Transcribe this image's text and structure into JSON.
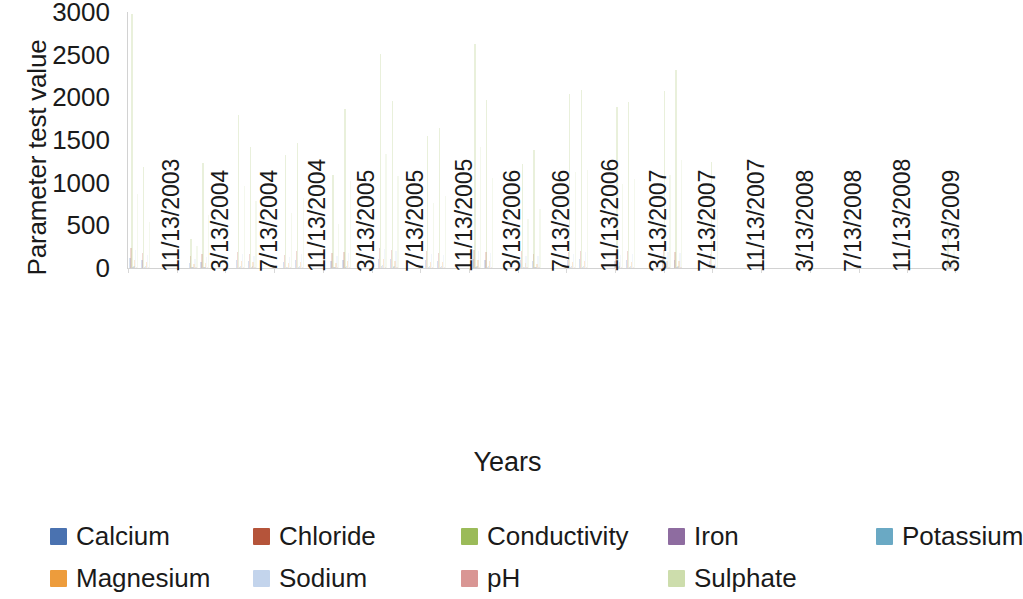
{
  "chart_data": {
    "type": "bar",
    "title": "",
    "xlabel": "Years",
    "ylabel": "Parameter test value",
    "ylim": [
      0,
      3000
    ],
    "y_ticks": [
      3000,
      2500,
      2000,
      1500,
      1000,
      500,
      0
    ],
    "grid": false,
    "legend_position": "bottom",
    "x_tick_labels": [
      "11/13/2003",
      "3/13/2004",
      "7/13/2004",
      "11/13/2004",
      "3/13/2005",
      "7/13/2005",
      "11/13/2005",
      "3/13/2006",
      "7/13/2006",
      "11/13/2006",
      "3/13/2007",
      "7/13/2007",
      "11/13/2007",
      "3/13/2008",
      "7/13/2008",
      "11/13/2008",
      "3/13/2009"
    ],
    "series": [
      {
        "name": "Calcium",
        "color": "#4a72b0",
        "values": [
          120,
          95,
          0,
          0,
          0,
          60,
          75,
          0,
          0,
          90,
          80,
          0,
          0,
          70,
          95,
          0,
          0,
          85,
          90,
          0,
          0,
          110,
          100,
          0,
          0,
          95,
          85,
          0,
          0,
          105,
          90,
          0,
          0,
          95,
          80,
          0,
          0,
          90,
          100,
          0,
          0,
          85,
          95,
          0,
          0,
          100,
          90,
          0,
          0,
          80,
          0,
          0,
          0,
          0,
          0,
          0,
          0,
          0,
          0,
          0,
          0,
          0,
          0,
          0,
          0,
          0,
          0,
          0,
          0,
          55
        ]
      },
      {
        "name": "Chloride",
        "color": "#b5543a",
        "values": [
          230,
          180,
          0,
          0,
          0,
          140,
          160,
          0,
          0,
          190,
          170,
          0,
          0,
          150,
          200,
          0,
          0,
          175,
          185,
          0,
          0,
          240,
          210,
          0,
          0,
          195,
          180,
          0,
          0,
          215,
          190,
          0,
          0,
          200,
          165,
          0,
          0,
          185,
          205,
          0,
          0,
          175,
          195,
          0,
          0,
          210,
          185,
          0,
          0,
          160,
          0,
          0,
          0,
          0,
          0,
          0,
          0,
          0,
          0,
          0,
          0,
          0,
          0,
          0,
          0,
          0,
          0,
          0,
          0,
          95
        ]
      },
      {
        "name": "Conductivity",
        "color": "#9bbb59",
        "values": [
          2980,
          1180,
          0,
          0,
          0,
          340,
          1230,
          0,
          0,
          1790,
          1420,
          0,
          0,
          1320,
          1460,
          0,
          0,
          1090,
          1860,
          0,
          0,
          2510,
          1960,
          0,
          0,
          1550,
          1640,
          0,
          0,
          2620,
          1970,
          0,
          0,
          1220,
          1380,
          0,
          0,
          2040,
          2090,
          0,
          0,
          1890,
          1950,
          0,
          0,
          2070,
          2320,
          0,
          0,
          1240,
          0,
          0,
          0,
          0,
          0,
          0,
          0,
          0,
          0,
          0,
          0,
          0,
          0,
          0,
          0,
          0,
          0,
          0,
          0,
          420
        ]
      },
      {
        "name": "Iron",
        "color": "#8e6ca0",
        "values": [
          15,
          8,
          0,
          0,
          0,
          5,
          9,
          0,
          0,
          12,
          10,
          0,
          0,
          7,
          11,
          0,
          0,
          9,
          13,
          0,
          0,
          18,
          14,
          0,
          0,
          11,
          10,
          0,
          0,
          16,
          12,
          0,
          0,
          9,
          8,
          0,
          0,
          13,
          15,
          0,
          0,
          11,
          12,
          0,
          0,
          14,
          13,
          0,
          0,
          7,
          0,
          0,
          0,
          0,
          0,
          0,
          0,
          0,
          0,
          0,
          0,
          0,
          0,
          0,
          0,
          0,
          0,
          0,
          0,
          4
        ]
      },
      {
        "name": "Potassium",
        "color": "#6aa9c4",
        "values": [
          25,
          18,
          0,
          0,
          0,
          12,
          16,
          0,
          0,
          22,
          19,
          0,
          0,
          15,
          21,
          0,
          0,
          17,
          24,
          0,
          0,
          30,
          26,
          0,
          0,
          20,
          18,
          0,
          0,
          28,
          23,
          0,
          0,
          17,
          15,
          0,
          0,
          22,
          25,
          0,
          0,
          19,
          21,
          0,
          0,
          24,
          23,
          0,
          0,
          14,
          0,
          0,
          0,
          0,
          0,
          0,
          0,
          0,
          0,
          0,
          0,
          0,
          0,
          0,
          0,
          0,
          0,
          0,
          0,
          8
        ]
      },
      {
        "name": "Magnesium",
        "color": "#ed9c3c",
        "values": [
          95,
          70,
          0,
          0,
          0,
          45,
          60,
          0,
          0,
          78,
          66,
          0,
          0,
          55,
          72,
          0,
          0,
          62,
          80,
          0,
          0,
          105,
          88,
          0,
          0,
          74,
          68,
          0,
          0,
          92,
          77,
          0,
          0,
          60,
          52,
          0,
          0,
          76,
          84,
          0,
          0,
          70,
          75,
          0,
          0,
          82,
          79,
          0,
          0,
          50,
          0,
          0,
          0,
          0,
          0,
          0,
          0,
          0,
          0,
          0,
          0,
          0,
          0,
          0,
          0,
          0,
          0,
          0,
          0,
          30
        ]
      },
      {
        "name": "Sodium",
        "color": "#c3d4ec",
        "values": [
          210,
          150,
          0,
          0,
          0,
          110,
          130,
          0,
          0,
          165,
          145,
          0,
          0,
          125,
          170,
          0,
          0,
          140,
          180,
          0,
          0,
          225,
          195,
          0,
          0,
          160,
          150,
          0,
          0,
          200,
          175,
          0,
          0,
          145,
          135,
          0,
          0,
          170,
          190,
          0,
          0,
          155,
          165,
          0,
          0,
          185,
          175,
          0,
          0,
          130,
          0,
          0,
          0,
          0,
          0,
          0,
          0,
          0,
          0,
          0,
          0,
          0,
          0,
          0,
          0,
          0,
          0,
          0,
          0,
          75
        ]
      },
      {
        "name": "pH",
        "color": "#d99694",
        "values": [
          8,
          7,
          0,
          0,
          0,
          7,
          7,
          0,
          0,
          8,
          7,
          0,
          0,
          7,
          8,
          0,
          0,
          7,
          8,
          0,
          0,
          8,
          8,
          0,
          0,
          7,
          7,
          0,
          0,
          8,
          7,
          0,
          0,
          7,
          7,
          0,
          0,
          8,
          8,
          0,
          0,
          7,
          8,
          0,
          0,
          8,
          7,
          0,
          0,
          7,
          0,
          0,
          0,
          0,
          0,
          0,
          0,
          0,
          0,
          0,
          0,
          0,
          0,
          0,
          0,
          0,
          0,
          0,
          0,
          7
        ]
      },
      {
        "name": "Sulphate",
        "color": "#cdddac",
        "values": [
          870,
          540,
          0,
          0,
          0,
          260,
          620,
          0,
          0,
          960,
          790,
          0,
          0,
          640,
          820,
          0,
          0,
          520,
          1020,
          0,
          0,
          1340,
          1080,
          0,
          0,
          760,
          840,
          0,
          0,
          1420,
          1060,
          0,
          0,
          580,
          690,
          0,
          0,
          1120,
          1150,
          0,
          0,
          980,
          1040,
          0,
          0,
          1090,
          1260,
          0,
          0,
          640,
          0,
          0,
          0,
          0,
          0,
          0,
          0,
          0,
          0,
          0,
          0,
          0,
          0,
          0,
          0,
          0,
          0,
          0,
          0,
          210
        ]
      }
    ]
  },
  "legend": {
    "items": [
      {
        "label": "Calcium",
        "color": "#4a72b0"
      },
      {
        "label": "Chloride",
        "color": "#b5543a"
      },
      {
        "label": "Conductivity",
        "color": "#9bbb59"
      },
      {
        "label": "Iron",
        "color": "#8e6ca0"
      },
      {
        "label": "Potassium",
        "color": "#6aa9c4"
      },
      {
        "label": "Magnesium",
        "color": "#ed9c3c"
      },
      {
        "label": "Sodium",
        "color": "#c3d4ec"
      },
      {
        "label": "pH",
        "color": "#d99694"
      },
      {
        "label": "Sulphate",
        "color": "#cdddac"
      }
    ]
  },
  "axes": {
    "y_title": "Parameter test value",
    "x_title": "Years"
  }
}
